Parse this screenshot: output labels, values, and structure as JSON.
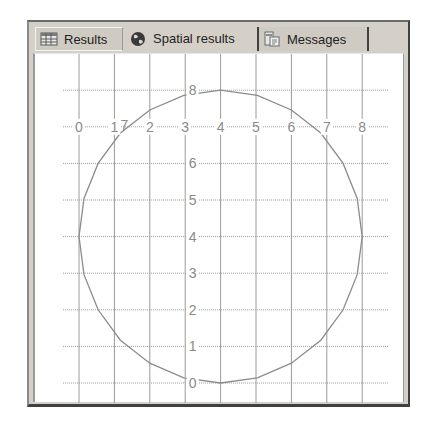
{
  "tabs": [
    {
      "label": "Results",
      "icon": "grid-icon",
      "active": false
    },
    {
      "label": "Spatial results",
      "icon": "globe-icon",
      "active": true
    },
    {
      "label": "Messages",
      "icon": "messages-icon",
      "active": false
    }
  ],
  "colors": {
    "panel_bg": "#d4d0c8",
    "grid": "#9a9a9a",
    "shape_stroke": "#8c8c8c",
    "tick_label": "#8a8a8a"
  },
  "chart_data": {
    "type": "scatter",
    "title": "",
    "xlabel": "",
    "ylabel": "",
    "xlim": [
      -0.45,
      9.05
    ],
    "ylim": [
      -0.55,
      8.35
    ],
    "grid": true,
    "x_ticks": [
      0,
      1,
      2,
      3,
      4,
      5,
      6,
      7,
      8
    ],
    "y_ticks": [
      0,
      1,
      2,
      3,
      4,
      5,
      6,
      7,
      8
    ],
    "x_tick_labels": [
      "0",
      "1",
      "2",
      "3",
      "4",
      "5",
      "6",
      "7",
      "8"
    ],
    "y_tick_labels": [
      "0",
      "1",
      "2",
      "3",
      "4",
      "5",
      "6",
      "7",
      "8"
    ],
    "x_axis_label_row_y": 7,
    "y_axis_label_col_x": 4,
    "series": [
      {
        "name": "polygon",
        "geometry": "circle polygon, center (4,4), radius 4",
        "points": [
          [
            8.0,
            4.0
          ],
          [
            7.86,
            5.04
          ],
          [
            7.46,
            6.0
          ],
          [
            6.83,
            6.83
          ],
          [
            6.0,
            7.46
          ],
          [
            5.04,
            7.86
          ],
          [
            4.0,
            8.0
          ],
          [
            2.96,
            7.86
          ],
          [
            2.0,
            7.46
          ],
          [
            1.17,
            6.83
          ],
          [
            0.54,
            6.0
          ],
          [
            0.14,
            5.04
          ],
          [
            0.0,
            4.0
          ],
          [
            0.14,
            2.96
          ],
          [
            0.54,
            2.0
          ],
          [
            1.17,
            1.17
          ],
          [
            2.0,
            0.54
          ],
          [
            2.96,
            0.14
          ],
          [
            4.0,
            0.0
          ],
          [
            5.04,
            0.14
          ],
          [
            6.0,
            0.54
          ],
          [
            6.83,
            1.17
          ],
          [
            7.46,
            2.0
          ],
          [
            7.86,
            2.96
          ]
        ]
      }
    ]
  }
}
